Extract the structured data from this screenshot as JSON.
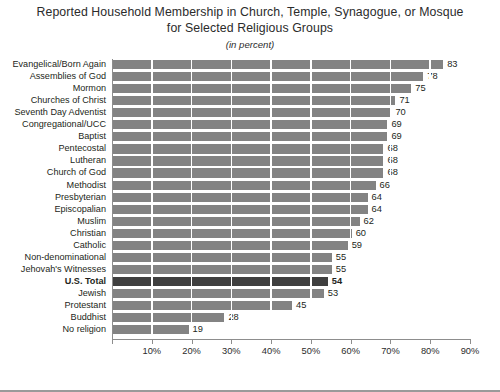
{
  "chart_data": {
    "type": "bar",
    "orientation": "horizontal",
    "title": "Reported Household Membership in Church, Temple, Synagogue, or Mosque for Selected Religious Groups",
    "title_line1": "Reported Household Membership in Church, Temple, Synagogue, or Mosque",
    "title_line2": "for Selected Religious Groups",
    "subtitle": "(in percent)",
    "xlabel": "",
    "ylabel": "",
    "xlim": [
      0,
      90
    ],
    "xticks": [
      0,
      10,
      20,
      30,
      40,
      50,
      60,
      70,
      80,
      90
    ],
    "xticklabels": [
      "",
      "10%",
      "20%",
      "30%",
      "40%",
      "50%",
      "60%",
      "70%",
      "80%",
      "90%"
    ],
    "grid": true,
    "legend": false,
    "bar_color": "#838383",
    "highlight_color": "#3f3f3f",
    "highlight_category": "U.S. Total",
    "categories": [
      "Evangelical/Born Again",
      "Assemblies of God",
      "Mormon",
      "Churches of Christ",
      "Seventh Day Adventist",
      "Congregational/UCC",
      "Baptist",
      "Pentecostal",
      "Lutheran",
      "Church of God",
      "Methodist",
      "Presbyterian",
      "Episcopalian",
      "Muslim",
      "Christian",
      "Catholic",
      "Non-denominational",
      "Jehovah's Witnesses",
      "U.S. Total",
      "Jewish",
      "Protestant",
      "Buddhist",
      "No religion"
    ],
    "values": [
      83,
      78,
      75,
      71,
      70,
      69,
      69,
      68,
      68,
      68,
      66,
      64,
      64,
      62,
      60,
      59,
      55,
      55,
      54,
      53,
      45,
      28,
      19
    ]
  }
}
